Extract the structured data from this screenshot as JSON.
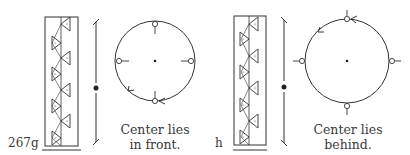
{
  "figure": {
    "panels": [
      {
        "id": "g",
        "label": "267g",
        "caption_line1": "Center lies",
        "caption_line2": "in front.",
        "rotation": "counterclockwise-from-bottom",
        "center_position": "in front"
      },
      {
        "id": "h",
        "label": "h",
        "caption_line1": "Center lies",
        "caption_line2": "behind.",
        "rotation": "counterclockwise-from-top",
        "center_position": "behind"
      }
    ],
    "colors": {
      "ink": "#2a2a2a",
      "background": "#ffffff"
    }
  }
}
